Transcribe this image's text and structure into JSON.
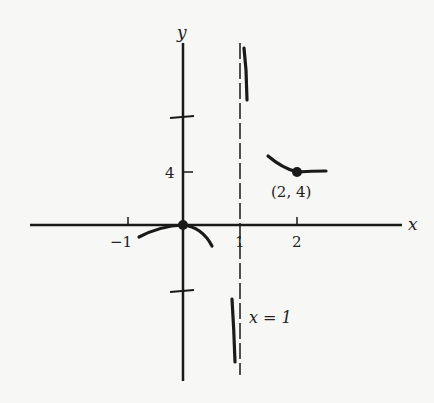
{
  "diagram": {
    "axes": {
      "x_label": "x",
      "y_label": "y"
    },
    "ticks": {
      "x": [
        {
          "value": -1,
          "label": "−1"
        },
        {
          "value": 1,
          "label": "1"
        },
        {
          "value": 2,
          "label": "2"
        }
      ],
      "y": [
        {
          "value": 4,
          "label": "4"
        }
      ]
    },
    "asymptote": {
      "label": "x = 1",
      "x": 1,
      "style": "dashed"
    },
    "points": [
      {
        "name": "origin",
        "x": 0,
        "y": 0,
        "label": ""
      },
      {
        "name": "local-min",
        "x": 2,
        "y": 4,
        "label": "(2, 4)"
      }
    ],
    "axis_breaks": [
      "y-axis above 4",
      "y-axis below 0"
    ],
    "colors": {
      "ink": "#1a1a1a",
      "background": "#f7f7f5"
    }
  }
}
